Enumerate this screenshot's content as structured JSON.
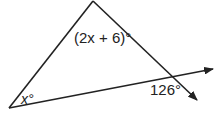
{
  "diagram": {
    "type": "triangle-exterior-angle",
    "labels": {
      "bottom_left_angle": "x°",
      "top_angle": "(2x + 6)°",
      "exterior_angle": "126°"
    },
    "colors": {
      "line": "#222222",
      "background": "#ffffff"
    }
  }
}
